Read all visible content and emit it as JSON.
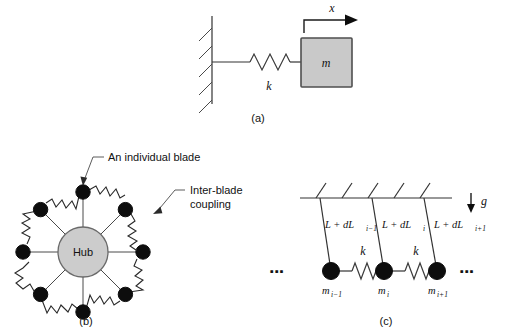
{
  "figure": {
    "background_color": "#ffffff",
    "ink_color": "#111111"
  },
  "panel_a": {
    "caption": "(a)",
    "spring_label": "k",
    "mass_label": "m",
    "coordinate_label": "x",
    "mass_fill_color": "#c9c9c9",
    "mass_border_color": "#4f4f4f",
    "description": "Single mass-spring oscillator attached to a hatched fixed wall, with displacement coordinate x to the right"
  },
  "panel_b": {
    "caption": "(b)",
    "hub_label": "Hub",
    "hub_fill_color": "#cccccc",
    "hub_border_color": "#6a6a6a",
    "blade_count": 8,
    "annotations": [
      {
        "text": "An individual blade",
        "target": "top-blade-node"
      },
      {
        "text_line_1": "Inter-blade",
        "text_line_2": "coupling",
        "target": "coupling-spring"
      }
    ],
    "description": "Bladed disk model: eight blade masses radially connected to a central hub by spokes, with springs coupling adjacent blades"
  },
  "panel_c": {
    "caption": "(c)",
    "gravity_label": "g",
    "spring_labels": [
      "k",
      "k"
    ],
    "ellipsis": "▪▪▪",
    "pendulums": [
      {
        "length_main": "L + dL",
        "length_sub": "i−1",
        "mass_main": "m",
        "mass_sub": "i−1"
      },
      {
        "length_main": "L + dL",
        "length_sub": "i",
        "mass_main": "m",
        "mass_sub": "i"
      },
      {
        "length_main": "L + dL",
        "length_sub": "i+1",
        "mass_main": "m",
        "mass_sub": "i+1"
      }
    ],
    "description": "Chain of coupled pendulums of slightly mistuned lengths hanging from a hatched ceiling, linked by springs k, under gravity g"
  }
}
